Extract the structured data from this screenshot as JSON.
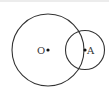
{
  "diagram": {
    "points": [
      {
        "id": "O",
        "label": "O"
      },
      {
        "id": "A",
        "label": "A"
      }
    ],
    "circles": [
      {
        "id": "circle-O",
        "center": "O"
      },
      {
        "id": "circle-A",
        "center": "A"
      }
    ],
    "stroke_color": "#333333"
  }
}
